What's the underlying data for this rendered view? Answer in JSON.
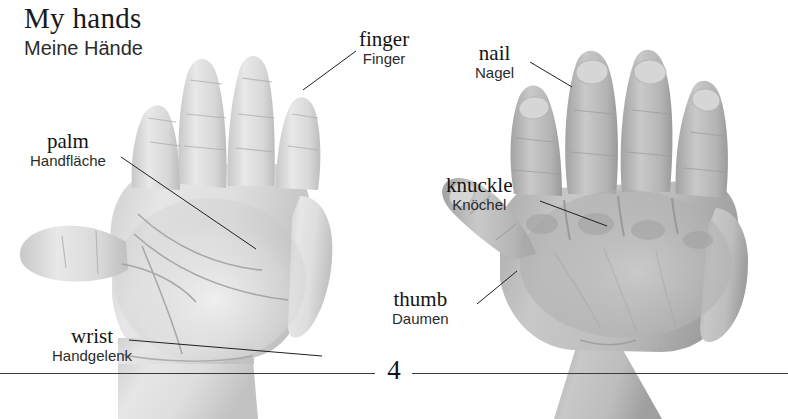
{
  "page": {
    "width": 788,
    "height": 419,
    "background": "#ffffff",
    "number": "4"
  },
  "heading": {
    "english": "My hands",
    "german": "Meine Hände"
  },
  "photos": [
    {
      "name": "left-hand-palm-photo",
      "description": "palm of a child's left hand, fingers spread, grayscale photograph"
    },
    {
      "name": "right-hand-back-photo",
      "description": "back of a child's right hand, fingers spread, grayscale photograph"
    }
  ],
  "labels": [
    {
      "key": "finger",
      "english": "finger",
      "german": "Finger",
      "target": "index fingertip of left hand"
    },
    {
      "key": "nail",
      "english": "nail",
      "german": "Nagel",
      "target": "fingernail on right hand"
    },
    {
      "key": "palm",
      "english": "palm",
      "german": "Handfläche",
      "target": "centre of left palm"
    },
    {
      "key": "knuckle",
      "english": "knuckle",
      "german": "Knöchel",
      "target": "knuckle on back of right hand"
    },
    {
      "key": "thumb",
      "english": "thumb",
      "german": "Daumen",
      "target": "thumb of right hand"
    },
    {
      "key": "wrist",
      "english": "wrist",
      "german": "Handgelenk",
      "target": "wrist of left hand"
    }
  ],
  "colors": {
    "text": "#141414",
    "text_secondary": "#2b2b2b",
    "rule": "#3a3a3a",
    "background": "#ffffff",
    "skin_light": "#e4e4e4",
    "skin_mid": "#bcbcbc",
    "skin_dark": "#9a9a9a"
  }
}
